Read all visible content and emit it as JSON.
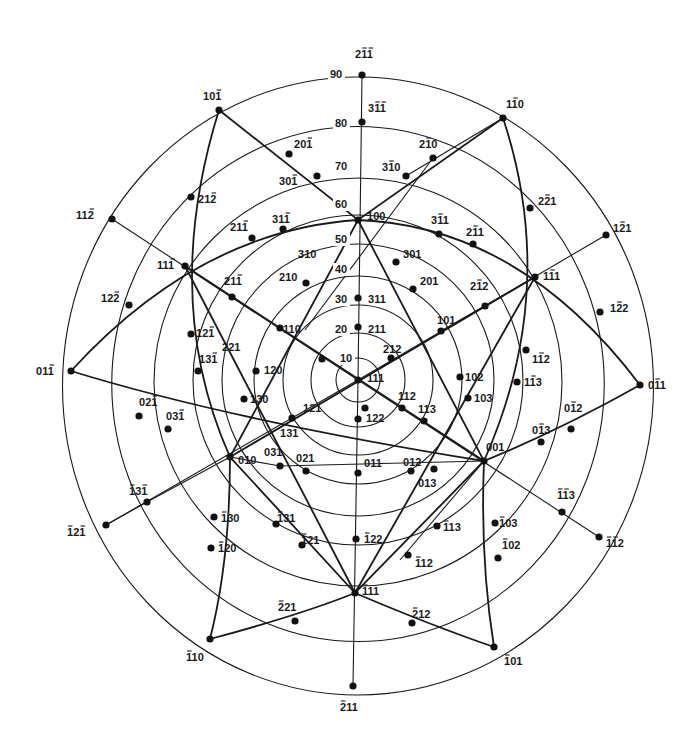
{
  "diagram": {
    "type": "stereographic-projection",
    "center_pole": "111",
    "center": [
      358,
      380
    ],
    "angle_circles": [
      {
        "deg": "10",
        "r": 22
      },
      {
        "deg": "20",
        "r": 47
      },
      {
        "deg": "30",
        "r": 75
      },
      {
        "deg": "40",
        "r": 104
      },
      {
        "deg": "50",
        "r": 136
      },
      {
        "deg": "60",
        "r": 165
      },
      {
        "deg": "70",
        "r": 204
      },
      {
        "deg": "80",
        "r": 250
      },
      {
        "deg": "90",
        "r": 300
      }
    ],
    "degree_labels": [
      {
        "text": "10",
        "x": 340,
        "y": 362
      },
      {
        "text": "20",
        "x": 335,
        "y": 333
      },
      {
        "text": "30",
        "x": 335,
        "y": 303
      },
      {
        "text": "40",
        "x": 335,
        "y": 273
      },
      {
        "text": "50",
        "x": 335,
        "y": 243
      },
      {
        "text": "60",
        "x": 335,
        "y": 208
      },
      {
        "text": "70",
        "x": 335,
        "y": 170
      },
      {
        "text": "80",
        "x": 335,
        "y": 127
      },
      {
        "text": "90",
        "x": 330,
        "y": 78
      }
    ],
    "poles": [
      {
        "label": "2̄1̄1̄",
        "tex": "2 -1 -1",
        "x": 362,
        "y": 75,
        "lx": 355,
        "ly": 58
      },
      {
        "label": "3̄1̄1̄",
        "tex": "3 -1 -1",
        "x": 362,
        "y": 122,
        "lx": 368,
        "ly": 112
      },
      {
        "label": "101̄",
        "tex": "1 0 -1",
        "x": 219,
        "y": 110,
        "lx": 203,
        "ly": 100
      },
      {
        "label": "201̄",
        "tex": "2 0 -1",
        "x": 289,
        "y": 154,
        "lx": 294,
        "ly": 148
      },
      {
        "label": "301̄",
        "tex": "3 0 -1",
        "x": 317,
        "y": 176,
        "lx": 279,
        "ly": 185
      },
      {
        "label": "1̄10",
        "tex": "1 -1 0",
        "x": 503,
        "y": 118,
        "lx": 506,
        "ly": 108
      },
      {
        "label": "2̄10",
        "tex": "2 -1 0",
        "x": 433,
        "y": 158,
        "lx": 419,
        "ly": 148
      },
      {
        "label": "3̄10",
        "tex": "3 -1 0",
        "x": 406,
        "y": 176,
        "lx": 382,
        "ly": 171
      },
      {
        "label": "21 2̄",
        "tex": "2 1 -2",
        "x": 191,
        "y": 197,
        "lx": 198,
        "ly": 203
      },
      {
        "label": "22̄1",
        "tex": "2 -2 1",
        "x": 530,
        "y": 208,
        "lx": 538,
        "ly": 205
      },
      {
        "label": "112̄",
        "tex": "1 1 -2",
        "x": 112,
        "y": 219,
        "lx": 76,
        "ly": 219
      },
      {
        "label": "1̄21",
        "tex": "1 -2 1",
        "x": 606,
        "y": 235,
        "lx": 613,
        "ly": 232
      },
      {
        "label": "21 1̄ (a)",
        "tex": "2 1 -1",
        "x": 252,
        "y": 238,
        "lx": 230,
        "ly": 231
      },
      {
        "label": "31 1̄",
        "tex": "3 1 -1",
        "x": 283,
        "y": 229,
        "lx": 272,
        "ly": 223
      },
      {
        "label": "100",
        "tex": "1 0 0",
        "x": 358,
        "y": 220,
        "lx": 367,
        "ly": 220
      },
      {
        "label": "3̄11",
        "tex": "3 -1 1",
        "x": 439,
        "y": 234,
        "lx": 431,
        "ly": 224
      },
      {
        "label": "2̄11",
        "tex": "2 -1 1",
        "x": 473,
        "y": 244,
        "lx": 466,
        "ly": 236
      },
      {
        "label": "11 1̄",
        "tex": "1 1 -1",
        "x": 185,
        "y": 266,
        "lx": 157,
        "ly": 269
      },
      {
        "label": "1̄11",
        "tex": "1 -1 1",
        "x": 535,
        "y": 277,
        "lx": 543,
        "ly": 280
      },
      {
        "label": "310",
        "tex": "3 1 0",
        "x": 0,
        "y": 0,
        "lx": 298,
        "ly": 258
      },
      {
        "label": "301",
        "tex": "3 0 1",
        "x": 396,
        "y": 262,
        "lx": 403,
        "ly": 258
      },
      {
        "label": "211̄ (b)",
        "tex": "2 1 -1",
        "x": 232,
        "y": 297,
        "lx": 224,
        "ly": 285
      },
      {
        "label": "210",
        "tex": "2 1 0",
        "x": 306,
        "y": 283,
        "lx": 279,
        "ly": 281
      },
      {
        "label": "201",
        "tex": "2 0 1",
        "x": 413,
        "y": 289,
        "lx": 420,
        "ly": 285
      },
      {
        "label": "2̄12",
        "tex": "2 -1 2",
        "x": 485,
        "y": 306,
        "lx": 470,
        "ly": 290
      },
      {
        "label": "122̄",
        "tex": "1 2 -2",
        "x": 129,
        "y": 305,
        "lx": 101,
        "ly": 302
      },
      {
        "label": "1̄22",
        "tex": "1 -2 2",
        "x": 600,
        "y": 312,
        "lx": 610,
        "ly": 312
      },
      {
        "label": "311",
        "tex": "3 1 1",
        "x": 358,
        "y": 298,
        "lx": 368,
        "ly": 303
      },
      {
        "label": "101",
        "tex": "1 0 1",
        "x": 441,
        "y": 331,
        "lx": 437,
        "ly": 324
      },
      {
        "label": "121̄",
        "tex": "1 2 -1",
        "x": 191,
        "y": 334,
        "lx": 196,
        "ly": 337
      },
      {
        "label": "110",
        "tex": "1 1 0",
        "x": 280,
        "y": 328,
        "lx": 283,
        "ly": 333
      },
      {
        "label": "211",
        "tex": "2 1 1",
        "x": 358,
        "y": 327,
        "lx": 368,
        "ly": 333
      },
      {
        "label": "212",
        "tex": "2 1 2",
        "x": 391,
        "y": 358,
        "lx": 383,
        "ly": 353
      },
      {
        "label": "221",
        "tex": "2 2 1",
        "x": 322,
        "y": 359,
        "lx": 222,
        "ly": 351
      },
      {
        "label": "131̄",
        "tex": "1 3 -1",
        "x": 198,
        "y": 371,
        "lx": 199,
        "ly": 363
      },
      {
        "label": "111",
        "tex": "1 1 1",
        "x": 358,
        "y": 380,
        "lx": 367,
        "ly": 382
      },
      {
        "label": "120",
        "tex": "1 2 0",
        "x": 256,
        "y": 371,
        "lx": 264,
        "ly": 374
      },
      {
        "label": "1̄12",
        "tex": "1 -1 2",
        "x": 526,
        "y": 350,
        "lx": 532,
        "ly": 363
      },
      {
        "label": "1̄13",
        "tex": "1 -1 3",
        "x": 517,
        "y": 382,
        "lx": 524,
        "ly": 386
      },
      {
        "label": "102",
        "tex": "1 0 2",
        "x": 460,
        "y": 377,
        "lx": 465,
        "ly": 381
      },
      {
        "label": "0 1̄ 1 (left)",
        "tex": "0 1 -1",
        "x": 71,
        "y": 371,
        "lx": 36,
        "ly": 375
      },
      {
        "label": "01̄1",
        "tex": "0 -1 1",
        "x": 640,
        "y": 385,
        "lx": 648,
        "ly": 389
      },
      {
        "label": "103",
        "tex": "1 0 3",
        "x": 468,
        "y": 398,
        "lx": 474,
        "ly": 402
      },
      {
        "label": "112",
        "tex": "1 1 2",
        "x": 402,
        "y": 408,
        "lx": 398,
        "ly": 400
      },
      {
        "label": "121",
        "tex": "1 2 1",
        "x": 365,
        "y": 408,
        "lx": 303,
        "ly": 412
      },
      {
        "label": "130",
        "tex": "1 3 0",
        "x": 244,
        "y": 399,
        "lx": 250,
        "ly": 403
      },
      {
        "label": "02 1̄",
        "tex": "0 2 -1",
        "x": 139,
        "y": 416,
        "lx": 139,
        "ly": 406
      },
      {
        "label": "03 1̄",
        "tex": "0 3 -1",
        "x": 168,
        "y": 429,
        "lx": 166,
        "ly": 420
      },
      {
        "label": "122",
        "tex": "1 2 2",
        "x": 358,
        "y": 419,
        "lx": 366,
        "ly": 422
      },
      {
        "label": "113",
        "tex": "1 1 3",
        "x": 424,
        "y": 421,
        "lx": 418,
        "ly": 413
      },
      {
        "label": "131",
        "tex": "1 3 1",
        "x": 292,
        "y": 418,
        "lx": 280,
        "ly": 437
      },
      {
        "label": "01̄2",
        "tex": "0 -1 2",
        "x": 571,
        "y": 429,
        "lx": 564,
        "ly": 412
      },
      {
        "label": "01̄3",
        "tex": "0 -1 3",
        "x": 541,
        "y": 442,
        "lx": 532,
        "ly": 434
      },
      {
        "label": "001",
        "tex": "0 0 1",
        "x": 484,
        "y": 461,
        "lx": 486,
        "ly": 451
      },
      {
        "label": "010",
        "tex": "0 1 0",
        "x": 230,
        "y": 457,
        "lx": 238,
        "ly": 464
      },
      {
        "label": "031",
        "tex": "0 3 1",
        "x": 280,
        "y": 466,
        "lx": 264,
        "ly": 456
      },
      {
        "label": "021",
        "tex": "0 2 1",
        "x": 306,
        "y": 471,
        "lx": 296,
        "ly": 462
      },
      {
        "label": "011",
        "tex": "0 1 1",
        "x": 358,
        "y": 473,
        "lx": 364,
        "ly": 467
      },
      {
        "label": "012",
        "tex": "0 1 2",
        "x": 411,
        "y": 471,
        "lx": 403,
        "ly": 466
      },
      {
        "label": "013",
        "tex": "0 1 3",
        "x": 434,
        "y": 469,
        "lx": 418,
        "ly": 487
      },
      {
        "label": "1̄3 1̄",
        "tex": "-1 3 -1",
        "x": 147,
        "y": 502,
        "lx": 129,
        "ly": 495
      },
      {
        "label": "1̄2 1̄",
        "tex": "-1 2 -1",
        "x": 106,
        "y": 525,
        "lx": 67,
        "ly": 536
      },
      {
        "label": "1̄1̄3",
        "tex": "-1 -1 3",
        "x": 562,
        "y": 512,
        "lx": 557,
        "ly": 499
      },
      {
        "label": "1̄1̄2",
        "tex": "-1 -1 2",
        "x": 599,
        "y": 537,
        "lx": 606,
        "ly": 547
      },
      {
        "label": "1̄13 (mid)",
        "tex": "-1 1 3",
        "x": 437,
        "y": 526,
        "lx": 443,
        "ly": 531
      },
      {
        "label": "1̄03",
        "tex": "-1 0 3",
        "x": 495,
        "y": 523,
        "lx": 499,
        "ly": 527
      },
      {
        "label": "1̄31",
        "tex": "-1 3 1",
        "x": 276,
        "y": 524,
        "lx": 277,
        "ly": 522
      },
      {
        "label": "1̄30",
        "tex": "-1 3 0",
        "x": 214,
        "y": 517,
        "lx": 221,
        "ly": 522
      },
      {
        "label": "1̄21",
        "tex": "-1 2 1",
        "x": 302,
        "y": 545,
        "lx": 301,
        "ly": 544
      },
      {
        "label": "1̄22",
        "tex": "-1 2 2",
        "x": 356,
        "y": 539,
        "lx": 364,
        "ly": 543
      },
      {
        "label": "1̄20",
        "tex": "-1 2 0",
        "x": 211,
        "y": 548,
        "lx": 218,
        "ly": 552
      },
      {
        "label": "1̄02",
        "tex": "-1 0 2",
        "x": 498,
        "y": 558,
        "lx": 502,
        "ly": 549
      },
      {
        "label": "1̄12",
        "tex": "-1 1 2",
        "x": 408,
        "y": 555,
        "lx": 415,
        "ly": 567
      },
      {
        "label": "1̄11",
        "tex": "-1 1 1",
        "x": 355,
        "y": 593,
        "lx": 362,
        "ly": 595
      },
      {
        "label": "2̄21",
        "tex": "-2 2 1",
        "x": 295,
        "y": 621,
        "lx": 278,
        "ly": 611
      },
      {
        "label": "2̄12",
        "tex": "-2 1 2",
        "x": 412,
        "y": 623,
        "lx": 412,
        "ly": 618
      },
      {
        "label": "1̄10",
        "tex": "-1 1 0",
        "x": 210,
        "y": 639,
        "lx": 186,
        "ly": 661
      },
      {
        "label": "1̄01",
        "tex": "-1 0 1",
        "x": 494,
        "y": 647,
        "lx": 504,
        "ly": 665
      },
      {
        "label": "2̄11",
        "tex": "-2 1 1",
        "x": 353,
        "y": 686,
        "lx": 340,
        "ly": 711
      }
    ]
  },
  "labels": {
    "p_211bb": "2",
    "p_211bb_b": "1",
    "p_211bb_c": "1"
  }
}
